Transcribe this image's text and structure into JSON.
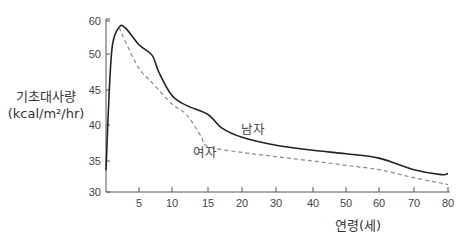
{
  "chart_data": {
    "type": "line",
    "title": "",
    "xlabel": "연령(세)",
    "ylabel_line1": "기초대사량",
    "ylabel_line2": "(kcal/m²/hr)",
    "ylabel": "기초대사량 (kcal/m²/hr)",
    "x_ticks": [
      5,
      10,
      15,
      20,
      30,
      40,
      50,
      60,
      70,
      80
    ],
    "y_ticks": [
      30,
      35,
      40,
      45,
      50,
      60
    ],
    "xlim": [
      0,
      80
    ],
    "ylim": [
      30,
      60
    ],
    "grid": false,
    "legend": "inline labels",
    "series": [
      {
        "name": "남자",
        "style": "solid",
        "color": "#222222",
        "x": [
          0,
          0.5,
          1,
          2,
          3,
          5,
          7,
          8,
          10,
          12,
          15,
          17,
          20,
          30,
          40,
          50,
          60,
          70,
          78,
          80
        ],
        "values": [
          33.5,
          45,
          53,
          58.2,
          57.8,
          52.8,
          49.8,
          47.5,
          44.2,
          42.8,
          41.5,
          39.6,
          38.3,
          37.2,
          36.5,
          36,
          35.4,
          33.6,
          32.8,
          33
        ]
      },
      {
        "name": "여자",
        "style": "dashed",
        "color": "#888888",
        "x": [
          2,
          3,
          5,
          7,
          10,
          12,
          14,
          15,
          20,
          30,
          40,
          50,
          60,
          70,
          80
        ],
        "values": [
          58,
          53.5,
          48,
          46,
          43,
          41.5,
          38.5,
          37,
          36.2,
          35.6,
          35,
          34.3,
          33.6,
          32.3,
          31.2
        ]
      }
    ],
    "annotations": [
      {
        "text": "남자",
        "near_x": 17,
        "near_y": 39.5
      },
      {
        "text": "여자",
        "near_x": 14,
        "near_y": 36.5
      }
    ]
  }
}
